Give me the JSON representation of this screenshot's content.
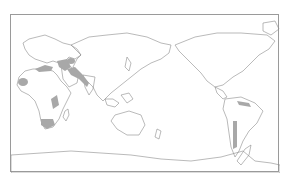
{
  "figure": {
    "title_cropped": "━━━━━ ━━━",
    "projection": "Pacific-centered world map",
    "colors": {
      "coastline": "#8c8c8c",
      "shaded_region": "#a8a8a8",
      "frame": "#9a9a9a",
      "background": "#ffffff"
    },
    "shaded_regions": [
      "West Africa coast",
      "Southern Africa",
      "East Africa",
      "Mediterranean coast",
      "Middle East / Arabian Peninsula",
      "Central Asia",
      "South Asia / Himalaya",
      "Northern South America (Andes)",
      "Western South America (Chile / Argentina)"
    ]
  }
}
